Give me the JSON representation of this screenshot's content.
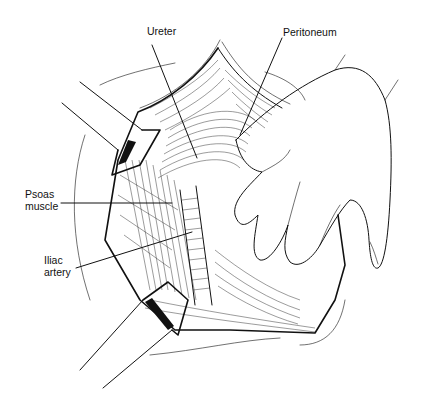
{
  "figure": {
    "labels": [
      {
        "id": "ureter",
        "text": "Ureter",
        "x": 147,
        "y": 31
      },
      {
        "id": "peritoneum",
        "text": "Peritoneum",
        "x": 283,
        "y": 28
      },
      {
        "id": "psoas_line1",
        "text": "Psoas",
        "x": 25,
        "y": 189
      },
      {
        "id": "psoas_line2",
        "text": "muscle",
        "x": 25,
        "y": 201
      },
      {
        "id": "iliac_line1",
        "text": "Iliac",
        "x": 44,
        "y": 253
      },
      {
        "id": "iliac_line2",
        "text": "artery",
        "x": 44,
        "y": 266
      }
    ],
    "colors": {
      "ink": "#111111",
      "background": "#ffffff"
    }
  }
}
